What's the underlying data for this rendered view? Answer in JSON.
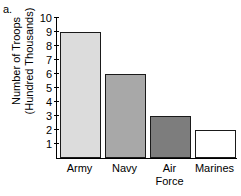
{
  "panel": {
    "label": "a."
  },
  "chart_data": {
    "type": "bar",
    "title": "",
    "xlabel": "",
    "ylabel_line1": "Number of Troops",
    "ylabel_line2": "(Hundred Thousands)",
    "categories": [
      "Army",
      "Navy",
      "Air Force",
      "Marines"
    ],
    "category_lines": [
      [
        "Army"
      ],
      [
        "Navy"
      ],
      [
        "Air",
        "Force"
      ],
      [
        "Marines"
      ]
    ],
    "values": [
      9,
      6,
      3,
      2
    ],
    "ylim": [
      0,
      10
    ],
    "yticks": [
      10,
      9,
      8,
      7,
      6,
      5,
      4,
      3,
      2,
      1
    ],
    "grid": false,
    "legend": false,
    "bar_colors": [
      "#dcdcdc",
      "#a8a8a8",
      "#7d7d7d",
      "#ffffff"
    ],
    "bar_border_color": "#1a1a1a"
  }
}
